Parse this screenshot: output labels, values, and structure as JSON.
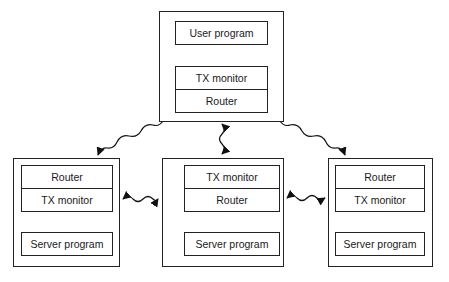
{
  "diagram": {
    "type": "distributed transaction processing architecture",
    "top_node": {
      "components": [
        "User program",
        "TX monitor",
        "Router"
      ]
    },
    "left_node": {
      "components": [
        "Router",
        "TX monitor",
        "Server program"
      ]
    },
    "middle_node": {
      "components": [
        "TX monitor",
        "Router",
        "Server program"
      ]
    },
    "right_node": {
      "components": [
        "Router",
        "TX monitor",
        "Server program"
      ]
    },
    "edges": [
      {
        "from": "top.user_program",
        "to": "top.tx_monitor",
        "style": "arrow down"
      },
      {
        "from": "top.tx_monitor",
        "to": "top.user_program",
        "style": "arrow up"
      },
      {
        "from": "top_node",
        "to": "left_node",
        "style": "wavy arrow"
      },
      {
        "from": "top_node",
        "to": "middle_node",
        "style": "wavy double arrow"
      },
      {
        "from": "top_node",
        "to": "right_node",
        "style": "wavy arrow"
      },
      {
        "from": "left_node",
        "to": "middle_node",
        "style": "wavy double arrow"
      },
      {
        "from": "middle_node",
        "to": "right_node",
        "style": "wavy double arrow"
      },
      {
        "from": "middle.tx_monitor",
        "to": "middle.router",
        "style": "curved double arrow"
      },
      {
        "from": "middle.router",
        "to": "middle.server_program",
        "style": "line"
      }
    ]
  }
}
